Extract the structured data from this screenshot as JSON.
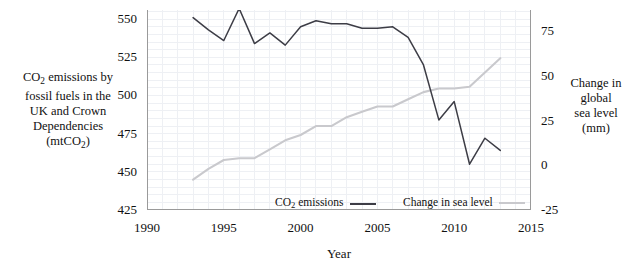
{
  "chart_data": {
    "type": "line",
    "title": "",
    "xlabel": "Year",
    "x": [
      1993,
      1994,
      1995,
      1996,
      1997,
      1998,
      1999,
      2000,
      2001,
      2002,
      2003,
      2004,
      2005,
      2006,
      2007,
      2008,
      2009,
      2010,
      2011,
      2012,
      2013
    ],
    "xlim": [
      1990,
      2015
    ],
    "xticks": [
      1990,
      1995,
      2000,
      2005,
      2010,
      2015
    ],
    "xticklabels": [
      "1990",
      "1995",
      "2000",
      "2005",
      "2010",
      "2015"
    ],
    "grid": true,
    "legend_position": "bottom-inside",
    "series": [
      {
        "name": "CO2 emissions",
        "legend_label": "CO₂ emissions",
        "axis": "left",
        "color": "#3d3d46",
        "ylabel": "CO₂ emissions by fossil fuels in the UK and Crown Dependencies (mtCO₂)",
        "ylim": [
          425,
          556
        ],
        "yticks": [
          425,
          450,
          475,
          500,
          525,
          550
        ],
        "yticklabels": [
          "425",
          "450",
          "475",
          "500",
          "525",
          "550"
        ],
        "values": [
          551,
          543,
          536,
          557,
          534,
          541,
          533,
          545,
          549,
          547,
          547,
          544,
          544,
          545,
          538,
          520,
          484,
          496,
          455,
          472,
          464
        ]
      },
      {
        "name": "Change in sea level",
        "legend_label": "Change in sea level",
        "axis": "right",
        "color": "#c9c9cd",
        "ylabel": "Change in global sea level (mm)",
        "ylim": [
          -25,
          87
        ],
        "yticks": [
          -25,
          0,
          25,
          50,
          75
        ],
        "yticklabels": [
          "-25",
          "0",
          "25",
          "50",
          "75"
        ],
        "values": [
          -8,
          -2,
          3,
          4,
          4,
          9,
          14,
          17,
          22,
          22,
          27,
          30,
          33,
          33,
          37,
          41,
          43,
          43,
          44,
          52,
          60
        ]
      }
    ]
  },
  "axes": {
    "left": {
      "title_lines": [
        "CO",
        "2",
        " emissions by",
        "fossil fuels in the",
        "UK and Crown",
        "Dependencies",
        "(mtCO",
        "2",
        ")"
      ],
      "title_line1_pre": "CO",
      "title_line1_sub": "2",
      "title_line1_post": " emissions by",
      "title_line2": "fossil fuels in the",
      "title_line3": "UK and Crown",
      "title_line4": "Dependencies",
      "title_line5_pre": "(mtCO",
      "title_line5_sub": "2",
      "title_line5_post": ")"
    },
    "right": {
      "title_line1": "Change in",
      "title_line2": "global",
      "title_line3": "sea level",
      "title_line4": "(mm)"
    },
    "bottom": {
      "title": "Year"
    }
  },
  "legend": {
    "co2_pre": "CO",
    "co2_sub": "2",
    "co2_post": " emissions",
    "sea_label": "Change in sea level"
  },
  "colors": {
    "co2_line": "#3d3d46",
    "sea_line": "#c9c9cd",
    "axis": "#9a9a9a",
    "grid": "#eef0f4",
    "text": "#111111",
    "background": "#ffffff"
  }
}
